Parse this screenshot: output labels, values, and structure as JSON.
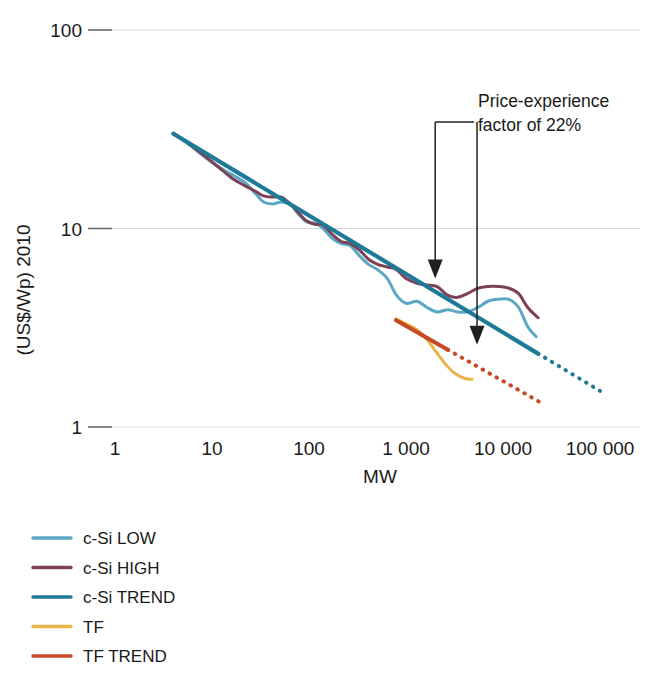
{
  "chart_data": {
    "type": "line",
    "title": "",
    "subtitle": "",
    "xlabel": "MW",
    "ylabel": "(US$/Wp) 2010",
    "xscale": "log",
    "yscale": "log",
    "xlim": [
      1,
      300000
    ],
    "ylim": [
      1,
      100
    ],
    "grid": true,
    "x_tick_labels": [
      "1",
      "10",
      "100",
      "1 000",
      "10 000",
      "100 000"
    ],
    "x_tick_values": [
      1,
      10,
      100,
      1000,
      10000,
      100000
    ],
    "y_tick_labels": [
      "1",
      "10",
      "100"
    ],
    "y_tick_values": [
      1,
      10,
      100
    ],
    "legend_position": "below-left",
    "annotations": [
      {
        "name": "price-experience-annotation",
        "line1": "Price-experience",
        "line2": "factor of 22%",
        "type": "bracket-with-two-arrows",
        "left_arrow_x_mw": 2000,
        "right_arrow_x_mw": 5400,
        "left_arrow_target_value": 5.6,
        "right_arrow_target_value": 2.6,
        "ratio_note": "22%"
      }
    ],
    "series": [
      {
        "name": "c-Si LOW",
        "color": "#5ba8c4",
        "style": "solid",
        "points": [
          [
            4.0,
            30.0
          ],
          [
            5.5,
            27.0
          ],
          [
            7.5,
            24.0
          ],
          [
            10.0,
            21.5
          ],
          [
            13.0,
            19.8
          ],
          [
            17.0,
            18.4
          ],
          [
            22.0,
            17.0
          ],
          [
            28.0,
            15.0
          ],
          [
            34.0,
            13.6
          ],
          [
            42.0,
            13.3
          ],
          [
            52.0,
            13.6
          ],
          [
            64.0,
            13.2
          ],
          [
            78.0,
            11.8
          ],
          [
            95.0,
            10.8
          ],
          [
            115.0,
            10.6
          ],
          [
            140.0,
            10.0
          ],
          [
            175.0,
            8.9
          ],
          [
            215.0,
            8.4
          ],
          [
            265.0,
            8.2
          ],
          [
            330.0,
            7.3
          ],
          [
            410.0,
            6.6
          ],
          [
            510.0,
            6.2
          ],
          [
            640.0,
            5.6
          ],
          [
            800.0,
            4.6
          ],
          [
            1000.0,
            4.2
          ],
          [
            1300.0,
            4.3
          ],
          [
            1650.0,
            4.0
          ],
          [
            2100.0,
            3.8
          ],
          [
            2700.0,
            3.9
          ],
          [
            3400.0,
            3.8
          ],
          [
            4300.0,
            3.8
          ],
          [
            5500.0,
            4.0
          ],
          [
            7000.0,
            4.3
          ],
          [
            9000.0,
            4.4
          ],
          [
            11500.0,
            4.4
          ],
          [
            14500.0,
            4.0
          ],
          [
            18000.0,
            3.2
          ],
          [
            22000.0,
            2.85
          ]
        ]
      },
      {
        "name": "c-Si HIGH",
        "color": "#7d4156",
        "style": "solid",
        "points": [
          [
            4.0,
            30.2
          ],
          [
            5.5,
            27.2
          ],
          [
            7.5,
            24.2
          ],
          [
            10.0,
            21.7
          ],
          [
            13.0,
            19.5
          ],
          [
            17.0,
            17.6
          ],
          [
            22.0,
            16.4
          ],
          [
            28.0,
            15.4
          ],
          [
            34.0,
            14.6
          ],
          [
            42.0,
            14.4
          ],
          [
            52.0,
            14.4
          ],
          [
            64.0,
            13.3
          ],
          [
            78.0,
            12.0
          ],
          [
            95.0,
            10.9
          ],
          [
            115.0,
            10.5
          ],
          [
            140.0,
            10.4
          ],
          [
            175.0,
            9.3
          ],
          [
            215.0,
            8.6
          ],
          [
            265.0,
            8.4
          ],
          [
            330.0,
            7.8
          ],
          [
            410.0,
            7.0
          ],
          [
            510.0,
            6.6
          ],
          [
            640.0,
            6.4
          ],
          [
            800.0,
            6.2
          ],
          [
            1000.0,
            5.6
          ],
          [
            1300.0,
            5.3
          ],
          [
            1650.0,
            5.2
          ],
          [
            2100.0,
            5.1
          ],
          [
            2700.0,
            4.6
          ],
          [
            3400.0,
            4.5
          ],
          [
            4300.0,
            4.7
          ],
          [
            5500.0,
            5.0
          ],
          [
            7000.0,
            5.1
          ],
          [
            9000.0,
            5.1
          ],
          [
            11500.0,
            5.0
          ],
          [
            14500.0,
            4.7
          ],
          [
            18000.0,
            4.0
          ],
          [
            23000.0,
            3.55
          ]
        ]
      },
      {
        "name": "c-Si TREND",
        "color": "#1e7a96",
        "style": "solid-then-dotted",
        "dotted_from_mw": 23000,
        "points": [
          [
            4.0,
            30.0
          ],
          [
            100000.0,
            1.52
          ]
        ]
      },
      {
        "name": "TF",
        "color": "#e8b54a",
        "style": "solid",
        "points": [
          [
            790.0,
            3.5
          ],
          [
            950.0,
            3.35
          ],
          [
            1150.0,
            3.2
          ],
          [
            1400.0,
            3.0
          ],
          [
            1700.0,
            2.7
          ],
          [
            2100.0,
            2.35
          ],
          [
            2600.0,
            2.05
          ],
          [
            3200.0,
            1.86
          ],
          [
            4000.0,
            1.76
          ],
          [
            4800.0,
            1.74
          ]
        ]
      },
      {
        "name": "TF TREND",
        "color": "#c64a26",
        "style": "solid-then-dotted",
        "dotted_from_mw": 2700,
        "points": [
          [
            790.0,
            3.45
          ],
          [
            25000.0,
            1.32
          ]
        ]
      }
    ]
  },
  "axes": {
    "y_label": "(US$/Wp) 2010",
    "x_label": "MW",
    "y_ticks": [
      {
        "label": "100",
        "value": 100
      },
      {
        "label": "10",
        "value": 10
      },
      {
        "label": "1",
        "value": 1
      }
    ],
    "x_ticks": [
      {
        "label": "1",
        "value": 1
      },
      {
        "label": "10",
        "value": 10
      },
      {
        "label": "100",
        "value": 100
      },
      {
        "label": "1 000",
        "value": 1000
      },
      {
        "label": "10 000",
        "value": 10000
      },
      {
        "label": "100 000",
        "value": 100000
      }
    ]
  },
  "annotation": {
    "line1": "Price-experience",
    "line2": "factor of 22%"
  },
  "legend": {
    "items": [
      {
        "label": "c-Si LOW",
        "color": "#5ba8c4"
      },
      {
        "label": "c-Si HIGH",
        "color": "#7d4156"
      },
      {
        "label": "c-Si TREND",
        "color": "#1e7a96"
      },
      {
        "label": "TF",
        "color": "#e8b54a"
      },
      {
        "label": "TF TREND",
        "color": "#c64a26"
      }
    ]
  },
  "colors": {
    "grid": "#d9d9d9",
    "text": "#1a1a1a",
    "annotation_stroke": "#202020",
    "background": "#ffffff"
  }
}
